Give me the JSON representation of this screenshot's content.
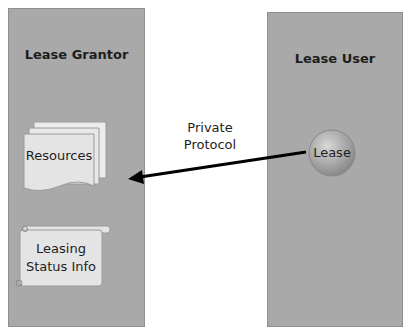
{
  "left_panel": {
    "title": "Lease Grantor"
  },
  "right_panel": {
    "title": "Lease User"
  },
  "resources": {
    "label": "Resources"
  },
  "status": {
    "line1": "Leasing",
    "line2": "Status Info"
  },
  "lease": {
    "label": "Lease"
  },
  "arrow": {
    "line1": "Private",
    "line2": "Protocol"
  },
  "colors": {
    "panel": "#a9a9a9",
    "doc": "#e6e6e6",
    "arrow": "#000000"
  }
}
